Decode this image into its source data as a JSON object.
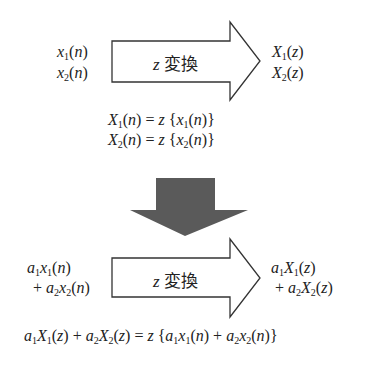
{
  "top": {
    "inputs": [
      "x1(n)",
      "x2(n)"
    ],
    "arrow_label_var": "z",
    "arrow_label_text": "変換",
    "outputs": [
      "X1(z)",
      "X2(z)"
    ],
    "equations": [
      "X1(n) = z{x1(n)}",
      "X2(n) = z{x2(n)}"
    ]
  },
  "bottom": {
    "inputs": [
      "a1x1(n)",
      "+a2x2(n)"
    ],
    "arrow_label_var": "z",
    "arrow_label_text": "変換",
    "outputs": [
      "a1X1(z)",
      "+a2X2(z)"
    ],
    "equation": "a1X1(z) + a2X2(z) = z{a1x1(n) + a2x2(n)}"
  },
  "colors": {
    "arrow_outline": "#333333",
    "down_arrow_fill": "#5a5a5a"
  }
}
